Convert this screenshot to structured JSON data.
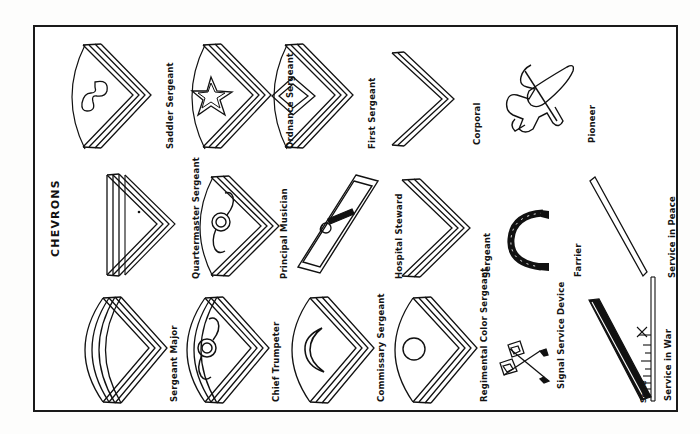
{
  "plate": {
    "title": "CHEVRONS",
    "border_color": "#1a1a1a",
    "ink_color": "#111111",
    "paper_color": "#ffffff",
    "scale_label": "Scale"
  },
  "rows": [
    {
      "row": 1,
      "items": [
        {
          "label": "Saddler Sergeant",
          "device": "caduceus-device",
          "stripes": 3,
          "arc": true
        },
        {
          "label": "Ordnance Sergeant",
          "device": "star-device",
          "stripes": 3,
          "arc": true
        },
        {
          "label": "First Sergeant",
          "device": "lozenge-device",
          "stripes": 3,
          "arc": true
        },
        {
          "label": "Corporal",
          "device": "none",
          "stripes": 2,
          "arc": false
        },
        {
          "label": "Pioneer",
          "device": "crossed-hatchets-device",
          "stripes": 0,
          "arc": false
        }
      ]
    },
    {
      "row": 2,
      "items": [
        {
          "label": "Quartermaster Sergeant",
          "device": "none",
          "stripes": 3,
          "arc": false
        },
        {
          "label": "Principal Musician",
          "device": "bugle-device",
          "stripes": 3,
          "arc": true
        },
        {
          "label": "Hospital Steward",
          "device": "caduceus-bar-device",
          "stripes": 1,
          "arc": false
        },
        {
          "label": "Sergeant",
          "device": "none",
          "stripes": 3,
          "arc": false
        },
        {
          "label": "Farrier",
          "device": "horseshoe-device",
          "stripes": 0,
          "arc": false
        },
        {
          "label": "Service in Peace",
          "device": "service-stripe-device",
          "stripes": 1,
          "arc": false
        }
      ]
    },
    {
      "row": 3,
      "items": [
        {
          "label": "Sergeant Major",
          "device": "none",
          "stripes": 3,
          "arc": true
        },
        {
          "label": "Chief Trumpeter",
          "device": "bugle-device",
          "stripes": 3,
          "arc": true
        },
        {
          "label": "Commissary Sergeant",
          "device": "crescent-device",
          "stripes": 3,
          "arc": true
        },
        {
          "label": "Regimental Color Sergeant",
          "device": "circle-device",
          "stripes": 3,
          "arc": true
        },
        {
          "label": "Signal Service Device",
          "device": "crossed-flags-device",
          "stripes": 0,
          "arc": false
        },
        {
          "label": "Service in War",
          "device": "service-stripe-device",
          "stripes": 1,
          "arc": false
        }
      ]
    }
  ]
}
